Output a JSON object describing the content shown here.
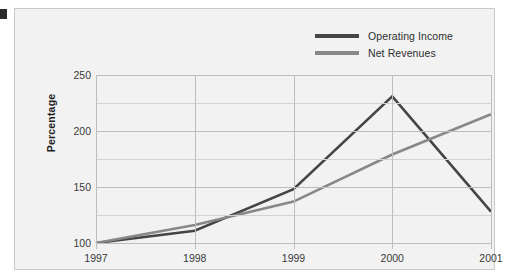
{
  "chart_data": {
    "type": "line",
    "title": "",
    "xlabel": "",
    "ylabel": "Percentage",
    "categories": [
      "1997",
      "1998",
      "1999",
      "2000",
      "2001"
    ],
    "x": [
      1997,
      1998,
      1999,
      2000,
      2001
    ],
    "series": [
      {
        "name": "Operating Income",
        "color": "#454545",
        "values": [
          100,
          111,
          148,
          231,
          128
        ]
      },
      {
        "name": "Net Revenues",
        "color": "#888888",
        "values": [
          100,
          116,
          137,
          179,
          215
        ]
      }
    ],
    "ylim": [
      100,
      250
    ],
    "yticks": [
      100,
      150,
      200,
      250
    ],
    "ytick_labels": [
      "100",
      "150",
      "200",
      "250"
    ],
    "yticks_minor": [
      125,
      175,
      225
    ],
    "grid": true,
    "legend_position": "top-right"
  },
  "legend": {
    "items": [
      {
        "label": "Operating Income",
        "color": "#454545"
      },
      {
        "label": "Net Revenues",
        "color": "#888888"
      }
    ]
  },
  "colors": {
    "panel_background": "#f2f2f2",
    "panel_border": "#c9c9c9",
    "gridline": "#bdbdbd",
    "gridline_minor": "#d3d3d3",
    "tick_text": "#3a3a3a",
    "axis_title": "#1f1f1f",
    "page_background": "#ffffff",
    "edge_marker": "#2b2b2b"
  }
}
